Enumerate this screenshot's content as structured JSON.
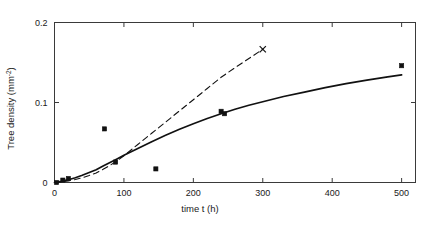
{
  "chart_data": {
    "type": "line",
    "title": "",
    "xlabel": "time  t  (h)",
    "ylabel": "Tree density (mm",
    "ylabel_sup": "-2",
    "ylabel_tail": ")",
    "xlim": [
      0,
      520
    ],
    "ylim": [
      0,
      0.2
    ],
    "grid": false,
    "legend": "none",
    "xticks": [
      0,
      100,
      200,
      300,
      400,
      500
    ],
    "xtick_labels": [
      "0",
      "100",
      "200",
      "300",
      "400",
      "500"
    ],
    "yticks": [
      0,
      0.1,
      0.2
    ],
    "ytick_labels": [
      "0",
      "0.1",
      "0.2"
    ],
    "series": [
      {
        "name": "model-solid",
        "style": "solid",
        "x": [
          0,
          10,
          20,
          30,
          40,
          50,
          60,
          70,
          80,
          90,
          100,
          120,
          140,
          160,
          180,
          200,
          220,
          240,
          260,
          280,
          300,
          330,
          360,
          390,
          420,
          450,
          480,
          500
        ],
        "values": [
          0.0,
          0.0015,
          0.0035,
          0.006,
          0.009,
          0.0125,
          0.016,
          0.0205,
          0.025,
          0.0295,
          0.034,
          0.0425,
          0.051,
          0.059,
          0.0665,
          0.0735,
          0.08,
          0.086,
          0.0915,
          0.0965,
          0.101,
          0.1075,
          0.113,
          0.1185,
          0.1235,
          0.128,
          0.132,
          0.1345
        ]
      },
      {
        "name": "model-dashed",
        "style": "dashed",
        "x": [
          0,
          10,
          20,
          30,
          40,
          50,
          60,
          70,
          80,
          90,
          100,
          120,
          140,
          160,
          180,
          200,
          220,
          240,
          260,
          280,
          300
        ],
        "values": [
          0.0,
          0.0008,
          0.002,
          0.0038,
          0.006,
          0.0088,
          0.012,
          0.0165,
          0.0215,
          0.027,
          0.0335,
          0.0475,
          0.0615,
          0.0755,
          0.0895,
          0.1035,
          0.1175,
          0.1315,
          0.1435,
          0.155,
          0.1665
        ],
        "end_marker": "x",
        "end_point": [
          300,
          0.1665
        ]
      }
    ],
    "scatter": {
      "name": "measurements",
      "marker": "filled-square",
      "points": [
        {
          "x": 3,
          "y": 0.0
        },
        {
          "x": 12,
          "y": 0.003
        },
        {
          "x": 20,
          "y": 0.005
        },
        {
          "x": 72,
          "y": 0.067
        },
        {
          "x": 88,
          "y": 0.0255
        },
        {
          "x": 146,
          "y": 0.017
        },
        {
          "x": 240,
          "y": 0.089
        },
        {
          "x": 245,
          "y": 0.086
        },
        {
          "x": 500,
          "y": 0.146
        }
      ]
    }
  }
}
